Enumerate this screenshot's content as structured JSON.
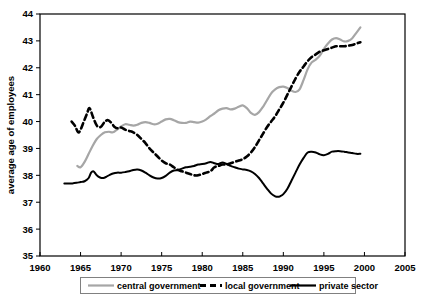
{
  "chart_data": {
    "type": "line",
    "title": "",
    "subtitle": "",
    "xlabel": "",
    "ylabel": "average age of employees",
    "xlim": [
      1960,
      2005
    ],
    "ylim": [
      35,
      44
    ],
    "xticks": [
      1960,
      1965,
      1970,
      1975,
      1980,
      1985,
      1990,
      1995,
      2000,
      2005
    ],
    "yticks": [
      35,
      36,
      37,
      38,
      39,
      40,
      41,
      42,
      43,
      44
    ],
    "xtick_labels": [
      "1960",
      "1965",
      "1970",
      "1975",
      "1980",
      "1985",
      "1990",
      "1995",
      "2000",
      "2005"
    ],
    "ytick_labels": [
      "35",
      "36",
      "37",
      "38",
      "39",
      "40",
      "41",
      "42",
      "43",
      "44"
    ],
    "grid": false,
    "legend_position": "bottom",
    "series": [
      {
        "name": "central government",
        "color": "#A6A6A6",
        "style": "solid",
        "width": 2.2,
        "x": [
          1964.6,
          1965.0,
          1965.5,
          1966.0,
          1966.5,
          1967.0,
          1967.5,
          1968.0,
          1968.5,
          1969.0,
          1969.5,
          1970.0,
          1970.5,
          1971.0,
          1971.5,
          1972.0,
          1972.5,
          1973.0,
          1973.5,
          1974.0,
          1974.5,
          1975.0,
          1975.5,
          1976.0,
          1976.5,
          1977.0,
          1977.5,
          1978.0,
          1978.5,
          1979.0,
          1979.5,
          1980.0,
          1980.5,
          1981.0,
          1981.5,
          1982.0,
          1982.5,
          1983.0,
          1983.5,
          1984.0,
          1984.5,
          1985.0,
          1985.5,
          1986.0,
          1986.5,
          1987.0,
          1987.5,
          1988.0,
          1988.5,
          1989.0,
          1989.5,
          1990.0,
          1990.5,
          1991.0,
          1991.5,
          1992.0,
          1992.5,
          1993.0,
          1993.5,
          1994.0,
          1994.5,
          1995.0,
          1995.5,
          1996.0,
          1996.5,
          1997.0,
          1997.5,
          1998.0,
          1998.5,
          1999.0,
          1999.5
        ],
        "y": [
          38.35,
          38.3,
          38.5,
          38.8,
          39.1,
          39.35,
          39.5,
          39.6,
          39.62,
          39.6,
          39.7,
          39.82,
          39.9,
          39.88,
          39.85,
          39.88,
          39.95,
          39.98,
          39.95,
          39.9,
          39.92,
          40.0,
          40.08,
          40.1,
          40.05,
          39.98,
          39.95,
          39.95,
          40.0,
          39.98,
          39.96,
          40.0,
          40.08,
          40.2,
          40.3,
          40.42,
          40.48,
          40.5,
          40.45,
          40.48,
          40.55,
          40.6,
          40.5,
          40.32,
          40.25,
          40.35,
          40.55,
          40.8,
          41.05,
          41.2,
          41.28,
          41.3,
          41.25,
          41.15,
          41.1,
          41.2,
          41.55,
          41.95,
          42.2,
          42.3,
          42.45,
          42.7,
          42.9,
          43.05,
          43.1,
          43.05,
          42.98,
          43.0,
          43.1,
          43.3,
          43.5
        ]
      },
      {
        "name": "local government",
        "color": "#000000",
        "style": "dashed",
        "width": 2.6,
        "x": [
          1963.9,
          1964.3,
          1964.7,
          1965.0,
          1965.4,
          1965.8,
          1966.1,
          1966.5,
          1967.0,
          1967.5,
          1968.0,
          1968.4,
          1968.8,
          1969.2,
          1969.6,
          1970.0,
          1970.5,
          1971.0,
          1971.5,
          1972.0,
          1972.5,
          1973.0,
          1973.5,
          1974.0,
          1974.5,
          1975.0,
          1975.5,
          1976.0,
          1976.5,
          1977.0,
          1977.5,
          1978.0,
          1978.5,
          1979.0,
          1979.5,
          1980.0,
          1980.5,
          1981.0,
          1981.5,
          1982.0,
          1982.5,
          1983.0,
          1983.5,
          1984.0,
          1984.5,
          1985.0,
          1985.5,
          1986.0,
          1986.5,
          1987.0,
          1987.5,
          1988.0,
          1988.5,
          1989.0,
          1989.5,
          1990.0,
          1990.5,
          1991.0,
          1991.5,
          1992.0,
          1992.5,
          1993.0,
          1993.5,
          1994.0,
          1994.5,
          1995.0,
          1995.5,
          1996.0,
          1996.5,
          1997.0,
          1997.5,
          1998.0,
          1998.5,
          1999.0,
          1999.5
        ],
        "y": [
          40.0,
          39.85,
          39.6,
          39.7,
          40.0,
          40.3,
          40.5,
          40.2,
          39.85,
          39.8,
          40.0,
          40.05,
          39.95,
          39.8,
          39.75,
          39.78,
          39.7,
          39.65,
          39.6,
          39.5,
          39.35,
          39.2,
          39.0,
          38.85,
          38.7,
          38.55,
          38.45,
          38.4,
          38.3,
          38.2,
          38.15,
          38.1,
          38.05,
          38.0,
          38.0,
          38.05,
          38.1,
          38.15,
          38.3,
          38.35,
          38.4,
          38.4,
          38.45,
          38.5,
          38.55,
          38.6,
          38.7,
          38.85,
          39.05,
          39.3,
          39.55,
          39.8,
          40.0,
          40.2,
          40.45,
          40.7,
          41.0,
          41.3,
          41.6,
          41.85,
          42.05,
          42.25,
          42.4,
          42.5,
          42.6,
          42.65,
          42.7,
          42.75,
          42.8,
          42.8,
          42.8,
          42.82,
          42.85,
          42.9,
          42.95
        ]
      },
      {
        "name": "private sector",
        "color": "#000000",
        "style": "solid",
        "width": 2.0,
        "x": [
          1963.0,
          1963.5,
          1964.0,
          1964.5,
          1965.0,
          1965.5,
          1966.0,
          1966.3,
          1966.6,
          1967.0,
          1967.4,
          1967.8,
          1968.2,
          1968.6,
          1969.0,
          1969.5,
          1970.0,
          1970.5,
          1971.0,
          1971.5,
          1972.0,
          1972.5,
          1973.0,
          1973.5,
          1974.0,
          1974.5,
          1975.0,
          1975.5,
          1976.0,
          1976.5,
          1977.0,
          1977.5,
          1978.0,
          1978.5,
          1979.0,
          1979.5,
          1980.0,
          1980.5,
          1981.0,
          1981.5,
          1982.0,
          1982.5,
          1983.0,
          1983.5,
          1984.0,
          1984.5,
          1985.0,
          1985.5,
          1986.0,
          1986.5,
          1987.0,
          1987.5,
          1988.0,
          1988.5,
          1989.0,
          1989.3,
          1989.6,
          1990.0,
          1990.5,
          1991.0,
          1991.5,
          1992.0,
          1992.5,
          1993.0,
          1993.5,
          1994.0,
          1994.5,
          1995.0,
          1995.5,
          1996.0,
          1996.5,
          1997.0,
          1997.5,
          1998.0,
          1998.5,
          1999.0,
          1999.5
        ],
        "y": [
          37.7,
          37.7,
          37.7,
          37.72,
          37.75,
          37.78,
          37.9,
          38.1,
          38.15,
          38.0,
          37.92,
          37.9,
          37.95,
          38.02,
          38.07,
          38.1,
          38.1,
          38.12,
          38.15,
          38.2,
          38.22,
          38.18,
          38.1,
          38.0,
          37.92,
          37.88,
          37.9,
          37.98,
          38.1,
          38.18,
          38.2,
          38.25,
          38.3,
          38.32,
          38.35,
          38.4,
          38.42,
          38.45,
          38.5,
          38.45,
          38.42,
          38.48,
          38.42,
          38.35,
          38.3,
          38.25,
          38.22,
          38.2,
          38.15,
          38.05,
          37.9,
          37.7,
          37.5,
          37.32,
          37.22,
          37.2,
          37.22,
          37.3,
          37.5,
          37.8,
          38.1,
          38.4,
          38.65,
          38.85,
          38.88,
          38.85,
          38.78,
          38.75,
          38.8,
          38.88,
          38.9,
          38.9,
          38.88,
          38.85,
          38.83,
          38.8,
          38.8
        ]
      }
    ],
    "legend": [
      {
        "label": "central government",
        "color": "#A6A6A6",
        "style": "solid"
      },
      {
        "label": "local government",
        "color": "#000000",
        "style": "dashed"
      },
      {
        "label": "private sector",
        "color": "#000000",
        "style": "solid"
      }
    ]
  }
}
